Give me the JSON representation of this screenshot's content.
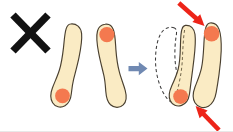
{
  "figure": {
    "title": "Incorrect foot positioning corrected by inward pressure",
    "background_color": "#ffffff",
    "width": 233,
    "height": 132
  },
  "colors": {
    "sole_fill": "#FAEBC4",
    "sole_outline": "#4a4030",
    "pressure_dot": "#F4794F",
    "transition_arrow": "#7089B2",
    "force_arrow": "#ED2418",
    "cross_mark": "#111111",
    "ghost_outline": "#3b3a3a"
  },
  "markers": {
    "cross": {
      "name": "incorrect-mark",
      "label": "X",
      "meaning": "incorrect"
    }
  },
  "panels": [
    {
      "id": "before",
      "name": "before-panel",
      "label": "",
      "soles": [
        {
          "id": "before-left-sole",
          "name": "left-sole",
          "label": "",
          "pressure_point": "heel"
        },
        {
          "id": "before-right-sole",
          "name": "right-sole",
          "label": "",
          "pressure_point": "forefoot"
        }
      ]
    },
    {
      "id": "after",
      "name": "after-panel",
      "label": "",
      "soles": [
        {
          "id": "after-left-sole",
          "name": "left-sole-shifted",
          "label": "",
          "pressure_point": "heel"
        },
        {
          "id": "after-right-sole",
          "name": "right-sole-shifted",
          "label": "",
          "pressure_point": "forefoot"
        }
      ],
      "ghost": {
        "name": "original-position-outline",
        "label": "",
        "style": "dashed"
      }
    }
  ],
  "arrows": {
    "transition": {
      "name": "transition-arrow",
      "label": "",
      "direction": "right",
      "color": "#7089B2"
    },
    "force_top": {
      "name": "force-arrow-top",
      "label": "",
      "direction": "down-right",
      "color": "#ED2418"
    },
    "force_bottom": {
      "name": "force-arrow-bottom",
      "label": "",
      "direction": "up-left",
      "color": "#ED2418"
    }
  }
}
